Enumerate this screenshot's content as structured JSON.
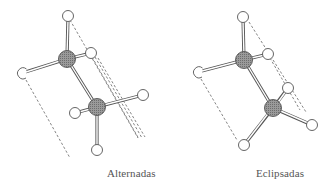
{
  "figure": {
    "type": "ethane-conformations",
    "molecules": [
      {
        "name": "staggered",
        "label": "Alternadas",
        "carbons": [
          [
            67,
            59
          ],
          [
            97,
            107
          ]
        ],
        "hydrogens": [
          [
            68,
            16
          ],
          [
            91,
            53
          ],
          [
            22,
            73
          ],
          [
            143,
            95
          ],
          [
            75,
            113
          ],
          [
            97,
            150
          ]
        ],
        "bonds": [
          [
            0,
            "C0"
          ],
          [
            1,
            "C0"
          ],
          [
            2,
            "C0"
          ],
          [
            3,
            "C1"
          ],
          [
            4,
            "C1"
          ],
          [
            5,
            "C1"
          ]
        ],
        "dashed_lines": [
          [
            70,
            20,
            138,
            138
          ],
          [
            92,
            57,
            140,
            139
          ],
          [
            96,
            58,
            143,
            138
          ],
          [
            26,
            80,
            70,
            158
          ]
        ]
      },
      {
        "name": "eclipsed",
        "label": "Eclipsadas",
        "carbons": [
          [
            244,
            60
          ],
          [
            273,
            108
          ]
        ],
        "hydrogens": [
          [
            243,
            17
          ],
          [
            268,
            54
          ],
          [
            198,
            72
          ],
          [
            288,
            88
          ],
          [
            312,
            125
          ],
          [
            244,
            145
          ]
        ],
        "bonds": [
          [
            0,
            "C0"
          ],
          [
            1,
            "C0"
          ],
          [
            2,
            "C0"
          ],
          [
            3,
            "C1"
          ],
          [
            4,
            "C1"
          ],
          [
            5,
            "C1"
          ]
        ],
        "dashed_lines": [
          [
            249,
            22,
            306,
            112
          ],
          [
            270,
            58,
            300,
            110
          ],
          [
            201,
            79,
            237,
            140
          ]
        ]
      }
    ],
    "colors": {
      "carbon": "#8a8a8a",
      "hydrogen_fill": "#ffffff",
      "outline": "#555555",
      "dash": "#666666"
    }
  }
}
